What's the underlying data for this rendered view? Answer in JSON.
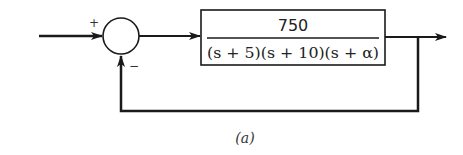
{
  "diagram": {
    "type": "feedback-control-block-diagram",
    "summing_junction": {
      "input_sign": "+",
      "feedback_sign": "−"
    },
    "plant_block": {
      "numerator": "750",
      "denominator": "(s + 5)(s + 10)(s + α)"
    },
    "feedback": "unity negative feedback",
    "caption": "(a)"
  },
  "colors": {
    "stroke": "#1a1a1a",
    "background": "#ffffff"
  }
}
